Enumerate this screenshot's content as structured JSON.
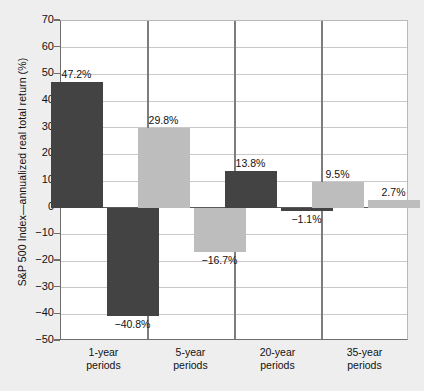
{
  "chart_data": {
    "type": "bar",
    "title": "",
    "xlabel": "",
    "ylabel": "S&P 500 Index—annualized real total return (%)",
    "ylim": [
      -50,
      70
    ],
    "ytick_values": [
      70,
      60,
      50,
      40,
      30,
      20,
      10,
      0,
      -10,
      -20,
      -30,
      -40,
      -50
    ],
    "ytick_labels": [
      "70",
      "60",
      "50",
      "40",
      "30",
      "20",
      "10",
      "0",
      "−10",
      "−20",
      "−30",
      "−40",
      "−50"
    ],
    "grid": true,
    "legend": "none",
    "categories": [
      "1-year periods",
      "5-year periods",
      "20-year periods",
      "35-year periods"
    ],
    "category_labels": [
      {
        "line1": "1-year",
        "line2": "periods"
      },
      {
        "line1": "5-year",
        "line2": "periods"
      },
      {
        "line1": "20-year",
        "line2": "periods"
      },
      {
        "line1": "35-year",
        "line2": "periods"
      }
    ],
    "series": [
      {
        "name": "Best",
        "values": [
          47.2,
          29.8,
          13.8,
          9.5
        ]
      },
      {
        "name": "Worst",
        "values": [
          -40.8,
          -16.7,
          -1.1,
          2.7
        ]
      }
    ],
    "bars": [
      {
        "panel": "1-year periods",
        "value": 47.2,
        "label": "47.2%",
        "color": "dark",
        "label_position": "above"
      },
      {
        "panel": "1-year periods",
        "value": -40.8,
        "label": "−40.8%",
        "color": "dark",
        "label_position": "below"
      },
      {
        "panel": "5-year periods",
        "value": 29.8,
        "label": "29.8%",
        "color": "light",
        "label_position": "above"
      },
      {
        "panel": "5-year periods",
        "value": -16.7,
        "label": "−16.7%",
        "color": "light",
        "label_position": "below"
      },
      {
        "panel": "20-year periods",
        "value": 13.8,
        "label": "13.8%",
        "color": "dark",
        "label_position": "above"
      },
      {
        "panel": "20-year periods",
        "value": -1.1,
        "label": "−1.1%",
        "color": "dark",
        "label_position": "below"
      },
      {
        "panel": "35-year periods",
        "value": 9.5,
        "label": "9.5%",
        "color": "light",
        "label_position": "above"
      },
      {
        "panel": "35-year periods",
        "value": 2.7,
        "label": "2.7%",
        "color": "light",
        "label_position": "above"
      }
    ],
    "colors": {
      "bar_dark": "#434343",
      "bar_light": "#bdbdbd",
      "plot_background": "#ffffff",
      "page_background": "#eeeeee",
      "gridline": "#c9c9c9",
      "axis": "#6e6e6e",
      "text": "#111111"
    }
  }
}
